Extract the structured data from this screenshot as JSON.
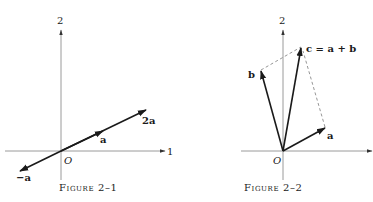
{
  "figures": [
    {
      "caption": "Figure 2–1",
      "axis_labels": {
        "vertical": "2",
        "horizontal": "1",
        "origin": "O"
      },
      "vectors": [
        {
          "label": "a",
          "description": "vector a"
        },
        {
          "label": "2a",
          "description": "vector 2a (twice a)"
        },
        {
          "label": "−a",
          "description": "vector -a (opposite of a)"
        }
      ]
    },
    {
      "caption": "Figure 2–2",
      "axis_labels": {
        "vertical": "2",
        "origin": "O"
      },
      "vectors": [
        {
          "label": "a",
          "description": "vector a"
        },
        {
          "label": "b",
          "description": "vector b"
        },
        {
          "label": "c = a + b",
          "description": "resultant c, parallelogram sum"
        }
      ],
      "construction": "dashed parallelogram lines from tips of a and b to tip of c"
    }
  ]
}
